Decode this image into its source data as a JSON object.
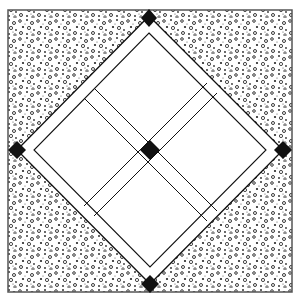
{
  "diagram": {
    "frame": {
      "x": 8,
      "y": 10,
      "w": 284,
      "h": 282,
      "stroke": "#555555"
    },
    "background_fabric": {
      "pattern": "speckled-print",
      "base": "#ffffff",
      "ink": "#222222"
    },
    "diamond": {
      "top": [
        149,
        16
      ],
      "right": [
        283,
        150
      ],
      "bottom": [
        150,
        284
      ],
      "left": [
        17,
        150
      ],
      "border_width": 12,
      "fill": "#ffffff",
      "line": "#111111"
    },
    "sashing": {
      "width": 10,
      "fill": "#ffffff",
      "line": "#111111"
    },
    "cornerstones": {
      "color": "#111111",
      "size": 11,
      "positions": [
        "top",
        "right",
        "bottom",
        "left",
        "center"
      ]
    },
    "patches": [
      "top-quadrant",
      "right-quadrant",
      "bottom-quadrant",
      "left-quadrant"
    ]
  }
}
